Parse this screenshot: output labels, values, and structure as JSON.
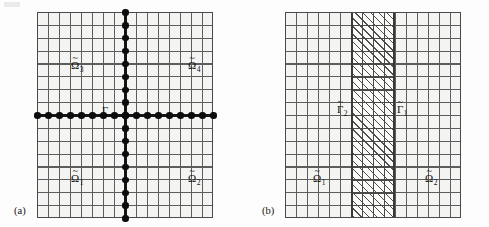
{
  "figure": {
    "caption_a": "(a)",
    "caption_b": "(b)",
    "background_color": "#fdfdfd",
    "grid_line_color": "#5d5d5d",
    "interface_color": "#151515",
    "hatch_color": "#4f4f4f"
  },
  "grid": {
    "columns": 16,
    "rows": 16,
    "cell_width_px": 11,
    "cell_height_px": 12.875
  },
  "panel_a": {
    "name": "(a)",
    "interface_label": {
      "text": "Γ",
      "name": "gamma",
      "has_tilde": false,
      "subscript": ""
    },
    "subdomains": [
      {
        "text": "Ω",
        "subscript": "1",
        "has_tilde": true,
        "position": "bottom-left"
      },
      {
        "text": "Ω",
        "subscript": "2",
        "has_tilde": true,
        "position": "bottom-right"
      },
      {
        "text": "Ω",
        "subscript": "3",
        "has_tilde": true,
        "position": "top-left"
      },
      {
        "text": "Ω",
        "subscript": "4",
        "has_tilde": true,
        "position": "top-right"
      }
    ],
    "cross": {
      "horizontal_row_index": 8,
      "vertical_column_index": 8,
      "dot_count_horizontal": 17,
      "dot_count_vertical": 17
    }
  },
  "panel_b": {
    "name": "(b)",
    "interface_labels": [
      {
        "text": "Γ",
        "subscript": "2",
        "has_tilde": true,
        "position": "left-edge-of-band"
      },
      {
        "text": "Γ",
        "subscript": "1",
        "has_tilde": true,
        "position": "right-edge-of-band"
      }
    ],
    "subdomains": [
      {
        "text": "Ω",
        "subscript": "1",
        "has_tilde": true,
        "position": "left"
      },
      {
        "text": "Ω",
        "subscript": "2",
        "has_tilde": true,
        "position": "right"
      }
    ],
    "overlap_band": {
      "start_column_index": 6,
      "end_column_index": 10,
      "column_span": 4,
      "fill": "diagonal-hatch"
    }
  }
}
